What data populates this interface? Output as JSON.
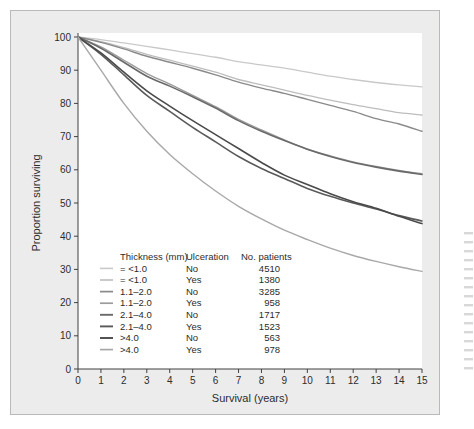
{
  "figure": {
    "background_color": "#ececed",
    "plot_background_color": "#ffffff",
    "border_color": "#b9b9bb"
  },
  "chart_data": {
    "type": "line",
    "title": "",
    "xlabel": "Survival (years)",
    "ylabel": "Proportion surviving",
    "xlim": [
      0,
      15
    ],
    "ylim": [
      0,
      100
    ],
    "xticks": [
      0,
      1,
      2,
      3,
      4,
      5,
      6,
      7,
      8,
      9,
      10,
      11,
      12,
      13,
      14,
      15
    ],
    "yticks": [
      0,
      10,
      20,
      30,
      40,
      50,
      60,
      70,
      80,
      90,
      100
    ],
    "grid": false,
    "legend_position": "inside-lower-left",
    "x": [
      0,
      1,
      2,
      3,
      4,
      5,
      6,
      7,
      8,
      9,
      10,
      11,
      12,
      13,
      14,
      15
    ],
    "series": [
      {
        "name": "=<1.0 / No",
        "thickness": "= <1.0",
        "ulceration": "No",
        "patients": "4510",
        "color": "#c9c9c9",
        "width": 1.3,
        "values": [
          100,
          99.2,
          98.2,
          97.2,
          96.1,
          95.0,
          93.9,
          92.6,
          91.6,
          90.6,
          89.4,
          88.2,
          87.2,
          86.3,
          85.6,
          85.0
        ]
      },
      {
        "name": "=<1.0 / Yes",
        "thickness": "= <1.0",
        "ulceration": "Yes",
        "patients": "1380",
        "color": "#bdbdbd",
        "width": 1.3,
        "values": [
          100,
          98.6,
          96.8,
          94.8,
          93.0,
          91.2,
          89.4,
          87.2,
          85.6,
          84.0,
          82.4,
          81.0,
          79.6,
          78.4,
          77.2,
          76.5
        ]
      },
      {
        "name": "1.1-2.0 / No",
        "thickness": "1.1–2.0",
        "ulceration": "No",
        "patients": "3285",
        "color": "#8a8a8a",
        "width": 1.4,
        "values": [
          100,
          98.4,
          96.4,
          94.2,
          92.4,
          90.6,
          88.6,
          86.4,
          84.6,
          83.0,
          81.2,
          79.4,
          77.6,
          75.4,
          73.8,
          71.6
        ]
      },
      {
        "name": "1.1-2.0 / Yes",
        "thickness": "1.1–2.0",
        "ulceration": "Yes",
        "patients": "958",
        "color": "#9c9c9c",
        "width": 1.4,
        "values": [
          100,
          97.0,
          93.0,
          89.0,
          85.8,
          82.4,
          79.0,
          75.2,
          72.0,
          69.0,
          66.2,
          64.2,
          62.4,
          61.0,
          59.8,
          58.8
        ]
      },
      {
        "name": "2.1-4.0 / No",
        "thickness": "2.1–4.0",
        "ulceration": "No",
        "patients": "1717",
        "color": "#6a6a6a",
        "width": 1.6,
        "values": [
          100,
          96.6,
          92.4,
          88.2,
          85.2,
          82.0,
          78.6,
          74.8,
          71.6,
          68.8,
          66.2,
          64.0,
          62.2,
          60.8,
          59.6,
          58.6
        ]
      },
      {
        "name": "2.1-4.0 / Yes",
        "thickness": "2.1–4.0",
        "ulceration": "Yes",
        "patients": "1523",
        "color": "#5a5a5a",
        "width": 1.6,
        "values": [
          100,
          94.8,
          88.6,
          82.4,
          77.6,
          72.8,
          68.4,
          64.0,
          60.4,
          57.4,
          54.4,
          52.0,
          50.0,
          48.2,
          46.2,
          44.6
        ]
      },
      {
        "name": ">4.0 / No",
        "thickness": ">4.0",
        "ulceration": "No",
        "patients": "563",
        "color": "#4a4a4a",
        "width": 1.6,
        "values": [
          100,
          95.2,
          89.4,
          83.8,
          79.2,
          74.8,
          70.6,
          66.4,
          62.2,
          58.4,
          55.6,
          52.8,
          50.4,
          48.4,
          46.0,
          43.8
        ]
      },
      {
        "name": ">4.0 / Yes",
        "thickness": ">4.0",
        "ulceration": "Yes",
        "patients": "978",
        "color": "#a8a8a8",
        "width": 1.4,
        "values": [
          100,
          90.0,
          80.0,
          71.6,
          64.6,
          58.8,
          53.6,
          49.0,
          45.2,
          41.8,
          39.0,
          36.4,
          34.2,
          32.4,
          30.8,
          29.4
        ]
      }
    ]
  },
  "legend": {
    "headers": {
      "thickness": "Thickness (mm)",
      "ulceration": "Ulceration",
      "patients": "No. patients"
    }
  }
}
